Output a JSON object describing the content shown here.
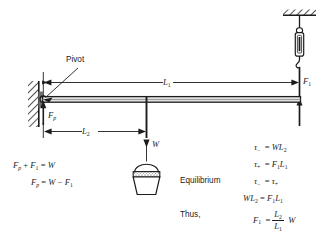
{
  "figure": {
    "type": "physics-diagram",
    "background": "#ffffff",
    "ink_color": "#1c1c1c"
  },
  "diagram": {
    "labels": {
      "pivot": "Pivot",
      "length_long": "L₁",
      "length_short": "L₂",
      "force_spring": "F₁",
      "force_pivot": "Fₚ",
      "weight": "W"
    },
    "parts": {
      "wall": "hatched-wall",
      "ceiling": "hatched-ceiling",
      "spring_scale": "spring-scale",
      "bucket": "hanging-bucket",
      "beam": "horizontal-beam",
      "pivot_point": "pivot-hinge"
    }
  },
  "equations": {
    "left": [
      {
        "lhs": "Fₚ + F₁",
        "rel": "=",
        "rhs": "W"
      },
      {
        "lhs": "Fₚ",
        "rel": "=",
        "rhs": "W − F₁"
      }
    ],
    "equilibrium_label": "Equilibrium",
    "thus_label": "Thus,",
    "right": [
      {
        "lhs": "τ₋",
        "rel": "=",
        "rhs": "WL₂"
      },
      {
        "lhs": "τ₊",
        "rel": "=",
        "rhs": "F₁L₁"
      },
      {
        "lhs": "τ₋",
        "rel": "=",
        "rhs": "τ₊"
      },
      {
        "lhs": "WL₂",
        "rel": "=",
        "rhs": "F₁L₁"
      }
    ],
    "result": {
      "lhs": "F₁",
      "rel": "=",
      "numerator": "L₂",
      "denominator": "L₁",
      "multiplier": "W"
    }
  }
}
